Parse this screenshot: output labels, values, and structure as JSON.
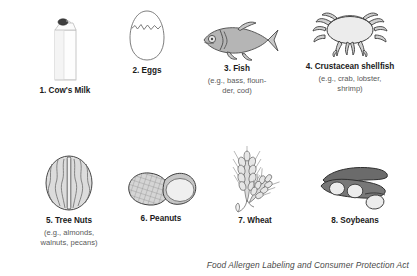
{
  "page": {
    "footer_note": "Food Allergen Labeling and Consumer Protection Act",
    "background_color": "#ffffff",
    "text_color": "#231f20",
    "muted_text_color": "#595959"
  },
  "allergens": [
    {
      "number": "1.",
      "label": "1. Cow's Milk",
      "examples": "",
      "icon": "milk-carton-icon"
    },
    {
      "number": "2.",
      "label": "2. Eggs",
      "examples": "",
      "icon": "cracked-egg-icon"
    },
    {
      "number": "3.",
      "label": "3. Fish",
      "examples": "(e.g., bass, floun-\nder, cod)",
      "icon": "fish-icon"
    },
    {
      "number": "4.",
      "label": "4. Crustacean shellfish",
      "examples": "(e.g., crab, lobster,\nshrimp)",
      "icon": "crab-icon"
    },
    {
      "number": "5.",
      "label": "5. Tree Nuts",
      "examples": "(e.g., almonds,\nwalnuts, pecans)",
      "icon": "walnut-icon"
    },
    {
      "number": "6.",
      "label": "6. Peanuts",
      "examples": "",
      "icon": "peanut-icon"
    },
    {
      "number": "7.",
      "label": "7. Wheat",
      "examples": "",
      "icon": "wheat-icon"
    },
    {
      "number": "8.",
      "label": "8. Soybeans",
      "examples": "",
      "icon": "soybean-pod-icon"
    }
  ]
}
